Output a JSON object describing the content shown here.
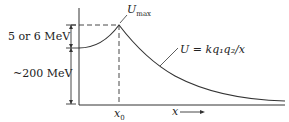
{
  "diagram": {
    "labels": {
      "u_max_main": "U",
      "u_max_sub": "max",
      "formula": "U = kq₁q₂/x",
      "barrier_height": "5 or 6 MeV",
      "energy_release": "~200 MeV",
      "x0_main": "x",
      "x0_sub": "0",
      "x_axis": "x"
    },
    "colors": {
      "line": "#333333",
      "background": "#ffffff"
    }
  }
}
